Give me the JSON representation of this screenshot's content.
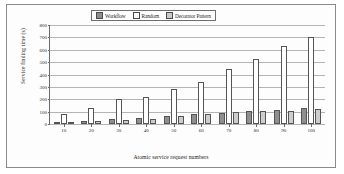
{
  "chart_data": {
    "type": "bar",
    "title": "",
    "xlabel": "Atomic service request numbers",
    "ylabel": "Service finding time (s)",
    "categories": [
      "10",
      "20",
      "30",
      "40",
      "50",
      "60",
      "70",
      "80",
      "90",
      "100"
    ],
    "series": [
      {
        "name": "Workflow",
        "values": [
          12,
          25,
          38,
          45,
          65,
          78,
          90,
          105,
          112,
          128
        ],
        "color": "#8f8f8f"
      },
      {
        "name": "Random",
        "values": [
          80,
          128,
          200,
          218,
          283,
          340,
          445,
          525,
          630,
          700
        ],
        "color": "#ffffff"
      },
      {
        "name": "Decorator Pattern",
        "values": [
          15,
          25,
          35,
          42,
          68,
          80,
          97,
          108,
          108,
          125
        ],
        "color": "#cdcdcd"
      }
    ],
    "ylim": [
      0,
      800
    ],
    "yticks": [
      0,
      100,
      200,
      300,
      400,
      500,
      600,
      700,
      800
    ],
    "grid": true,
    "legend_position": "top-center"
  },
  "legend": {
    "items": [
      {
        "label": "Workflow",
        "icon": "legend-swatch-workflow"
      },
      {
        "label": "Random",
        "icon": "legend-swatch-random"
      },
      {
        "label": "Decorator Pattern",
        "icon": "legend-swatch-decorator"
      }
    ]
  }
}
